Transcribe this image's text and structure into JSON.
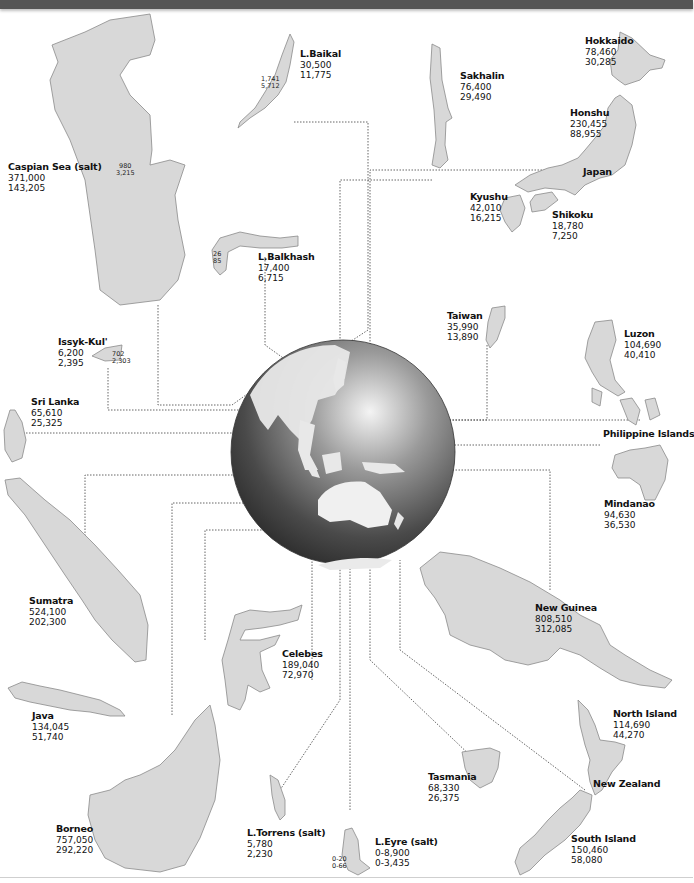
{
  "figure": {
    "units_note": "first value sq km, second value sq mi",
    "colors": {
      "land": "#d8d8d8",
      "land_stroke": "#8a8a8a",
      "globe_dark": "#3a3a3a",
      "globe_light": "#f2f2f2",
      "leader_line": "#555555",
      "top_bar": "#555555"
    }
  },
  "features": {
    "caspian": {
      "name": "Caspian Sea (salt)",
      "area_km": "371,000",
      "area_mi": "143,205",
      "depth_m": "980",
      "depth_ft": "3,215"
    },
    "baikal": {
      "name": "L.Baikal",
      "area_km": "30,500",
      "area_mi": "11,775",
      "depth_m": "1,741",
      "depth_ft": "5,712"
    },
    "balkhash": {
      "name": "L.Balkhash",
      "area_km": "17,400",
      "area_mi": "6,715",
      "depth_m": "26",
      "depth_ft": "85"
    },
    "issyk_kul": {
      "name": "Issyk-Kul'",
      "area_km": "6,200",
      "area_mi": "2,395",
      "depth_m": "702",
      "depth_ft": "2,303"
    },
    "sri_lanka": {
      "name": "Sri Lanka",
      "area_km": "65,610",
      "area_mi": "25,325"
    },
    "sakhalin": {
      "name": "Sakhalin",
      "area_km": "76,400",
      "area_mi": "29,490"
    },
    "hokkaido": {
      "name": "Hokkaido",
      "area_km": "78,460",
      "area_mi": "30,285"
    },
    "honshu": {
      "name": "Honshu",
      "area_km": "230,455",
      "area_mi": "88,955"
    },
    "japan": {
      "name": "Japan"
    },
    "kyushu": {
      "name": "Kyushu",
      "area_km": "42,010",
      "area_mi": "16,215"
    },
    "shikoku": {
      "name": "Shikoku",
      "area_km": "18,780",
      "area_mi": "7,250"
    },
    "taiwan": {
      "name": "Taiwan",
      "area_km": "35,990",
      "area_mi": "13,890"
    },
    "luzon": {
      "name": "Luzon",
      "area_km": "104,690",
      "area_mi": "40,410"
    },
    "philippines": {
      "name": "Philippine Islands"
    },
    "mindanao": {
      "name": "Mindanao",
      "area_km": "94,630",
      "area_mi": "36,530"
    },
    "sumatra": {
      "name": "Sumatra",
      "area_km": "524,100",
      "area_mi": "202,300"
    },
    "java": {
      "name": "Java",
      "area_km": "134,045",
      "area_mi": "51,740"
    },
    "celebes": {
      "name": "Celebes",
      "area_km": "189,040",
      "area_mi": "72,970"
    },
    "new_guinea": {
      "name": "New Guinea",
      "area_km": "808,510",
      "area_mi": "312,085"
    },
    "borneo": {
      "name": "Borneo",
      "area_km": "757,050",
      "area_mi": "292,220"
    },
    "torrens": {
      "name": "L.Torrens (salt)",
      "area_km": "5,780",
      "area_mi": "2,230"
    },
    "eyre": {
      "name": "L.Eyre (salt)",
      "area_km": "0-8,900",
      "area_mi": "0-3,435",
      "depth_m": "0-20",
      "depth_ft": "0-66"
    },
    "tasmania": {
      "name": "Tasmania",
      "area_km": "68,330",
      "area_mi": "26,375"
    },
    "north_island": {
      "name": "North Island",
      "area_km": "114,690",
      "area_mi": "44,270"
    },
    "new_zealand": {
      "name": "New Zealand"
    },
    "south_island": {
      "name": "South Island",
      "area_km": "150,460",
      "area_mi": "58,080"
    }
  }
}
